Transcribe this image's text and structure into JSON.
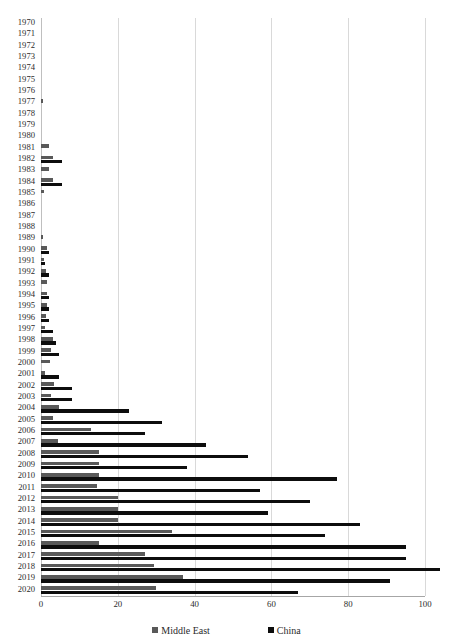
{
  "chart_data": {
    "type": "bar",
    "orientation": "horizontal",
    "title": "",
    "xlabel": "",
    "ylabel": "",
    "xlim": [
      0,
      106
    ],
    "ylim": null,
    "grid": true,
    "gridlines_x": [
      0,
      20,
      40,
      60,
      80,
      100
    ],
    "xticks": [
      "0",
      "20",
      "40",
      "60",
      "80",
      "100"
    ],
    "xtick_values": [
      0,
      20,
      40,
      60,
      80,
      100
    ],
    "legend_position": "bottom",
    "categories": [
      "1970",
      "1971",
      "1972",
      "1973",
      "1974",
      "1975",
      "1976",
      "1977",
      "1978",
      "1979",
      "1980",
      "1981",
      "1982",
      "1983",
      "1984",
      "1985",
      "1986",
      "1987",
      "1988",
      "1989",
      "1990",
      "1991",
      "1992",
      "1993",
      "1994",
      "1995",
      "1996",
      "1997",
      "1998",
      "1999",
      "2000",
      "2001",
      "2002",
      "2003",
      "2004",
      "2005",
      "2006",
      "2007",
      "2008",
      "2009",
      "2010",
      "2011",
      "2012",
      "2013",
      "2014",
      "2015",
      "2016",
      "2017",
      "2018",
      "2019",
      "2020"
    ],
    "series": [
      {
        "name": "Middle East",
        "color": "#595959",
        "values": [
          0,
          0,
          0,
          0,
          0,
          0,
          0,
          0.6,
          0,
          0,
          0,
          2.2,
          3.0,
          2.2,
          3.0,
          0.8,
          0,
          0,
          0,
          0.5,
          1.6,
          0.7,
          1.4,
          1.5,
          1.6,
          1.5,
          1.4,
          1.1,
          3.0,
          2.6,
          2.4,
          1.1,
          3.4,
          2.6,
          4.6,
          3.2,
          13.0,
          4.4,
          15.0,
          15.0,
          15.0,
          14.6,
          20.0,
          20.0,
          20.0,
          34.0,
          15.0,
          27.0,
          29.5,
          37.0,
          30.0
        ]
      },
      {
        "name": "China",
        "color": "#0d0d0d",
        "values": [
          0,
          0,
          0,
          0,
          0,
          0,
          0,
          0,
          0,
          0,
          0,
          0,
          5.5,
          0,
          5.5,
          0,
          0,
          0,
          0,
          0,
          2.2,
          1.0,
          2.0,
          0,
          2.2,
          2.0,
          2.0,
          3.0,
          4.0,
          4.6,
          0,
          4.6,
          8.0,
          8.0,
          23.0,
          31.5,
          27.0,
          43.0,
          54.0,
          38.0,
          77.0,
          57.0,
          70.0,
          59.0,
          83.0,
          74.0,
          95.0,
          95.0,
          104.0,
          91.0,
          67.0
        ]
      }
    ]
  },
  "legend": {
    "items": [
      {
        "label": "Middle East",
        "color": "#595959"
      },
      {
        "label": "China",
        "color": "#0d0d0d"
      }
    ]
  },
  "title_sliver": ""
}
